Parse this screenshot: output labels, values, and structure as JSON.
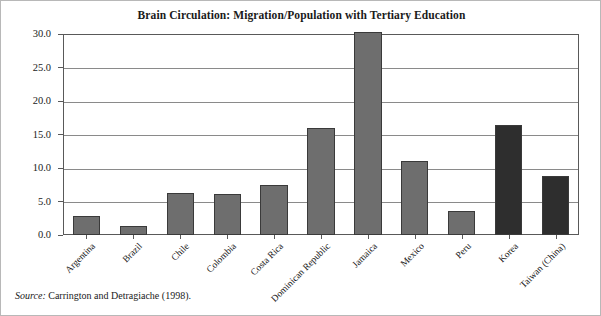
{
  "figure": {
    "title": "Brain Circulation: Migration/Population with Tertiary Education",
    "source_label": "Source:",
    "source_text": " Carrington and Detragiache (1998)."
  },
  "colors": {
    "bar_light": "#6e6e6e",
    "bar_dark": "#2e2e2e",
    "bar_outline": "#3a3a3a",
    "grid": "#8a8a8a",
    "frame": "#595959",
    "page_border": "#b8b8b8",
    "text": "#161616",
    "background": "#ffffff"
  },
  "chart_data": {
    "type": "bar",
    "title": "Brain Circulation: Migration/Population with Tertiary Education",
    "xlabel": "",
    "ylabel": "",
    "ylim": [
      0.0,
      30.0
    ],
    "yticks": [
      "0.0",
      "5.0",
      "10.0",
      "15.0",
      "20.0",
      "25.0",
      "30.0"
    ],
    "ytick_values": [
      0.0,
      5.0,
      10.0,
      15.0,
      20.0,
      25.0,
      30.0
    ],
    "grid": true,
    "legend": "none",
    "categories": [
      "Argentina",
      "Brazil",
      "Chile",
      "Colombia",
      "Costa Rica",
      "Dominican Republic",
      "Jamaica",
      "Mexico",
      "Peru",
      "Korea",
      "Taiwan (China)"
    ],
    "values": [
      2.8,
      1.4,
      6.2,
      6.1,
      7.4,
      16.0,
      30.3,
      11.1,
      3.6,
      16.4,
      8.8
    ],
    "bar_shades": [
      "light",
      "light",
      "light",
      "light",
      "light",
      "light",
      "light",
      "light",
      "light",
      "dark",
      "dark"
    ]
  }
}
